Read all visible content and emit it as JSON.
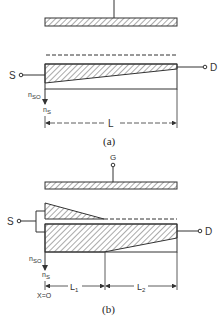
{
  "figure_a": {
    "caption": "(a)",
    "source_label": "S",
    "drain_label": "D",
    "density_start_label": "n",
    "density_start_sub": "SO",
    "density_axis_label": "n",
    "density_axis_sub": "S",
    "length_label": "L"
  },
  "figure_b": {
    "caption": "(b)",
    "gate_label": "G",
    "source_label": "S",
    "drain_label": "D",
    "density_start_label": "n",
    "density_start_sub": "SO",
    "density_axis_label": "n",
    "density_axis_sub": "S",
    "origin_label": "X=O",
    "length1_label": "L",
    "length1_sub": "1",
    "length2_label": "L",
    "length2_sub": "2"
  },
  "colors": {
    "line": "#333333",
    "hatch": "#555555",
    "background": "#ffffff"
  }
}
